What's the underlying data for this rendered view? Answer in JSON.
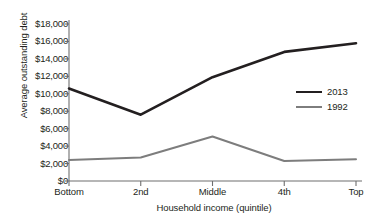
{
  "chart_data": {
    "type": "line",
    "title": "",
    "xlabel": "Household income (quintile)",
    "ylabel": "Average outstanding debt",
    "categories": [
      "Bottom",
      "2nd",
      "Middle",
      "4th",
      "Top"
    ],
    "ylim": [
      0,
      18000
    ],
    "ytick_step": 2000,
    "ytick_labels": [
      "$0",
      "$2,000",
      "$4,000",
      "$6,000",
      "$8,000",
      "$10,000",
      "$12,000",
      "$14,000",
      "$16,000",
      "$18,000"
    ],
    "ytick_values": [
      0,
      2000,
      4000,
      6000,
      8000,
      10000,
      12000,
      14000,
      16000,
      18000
    ],
    "grid": false,
    "legend_position": "right-middle",
    "series": [
      {
        "name": "2013",
        "color": "#231f20",
        "width": 2.6,
        "values": [
          10600,
          7600,
          11900,
          14800,
          15800
        ]
      },
      {
        "name": "1992",
        "color": "#7d7d7d",
        "width": 2.0,
        "values": [
          2400,
          2700,
          5100,
          2300,
          2500
        ]
      }
    ]
  },
  "legend": {
    "items": [
      {
        "label": "2013"
      },
      {
        "label": "1992"
      }
    ]
  },
  "colors": {
    "axis": "#6f6f6f",
    "text": "#231f20",
    "series_2013": "#231f20",
    "series_1992": "#7d7d7d",
    "background": "#ffffff"
  }
}
